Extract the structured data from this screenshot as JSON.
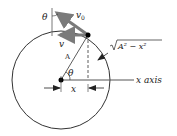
{
  "diagram": {
    "labels": {
      "theta_top": "θ",
      "v0": "v",
      "v0_sub": "0",
      "v": "v",
      "sqrt_expr": "A² − x²",
      "radius": "A",
      "theta_center": "θ",
      "x_axis": "x axis",
      "x_dim": "x"
    },
    "colors": {
      "arrow": "#7a7a7a",
      "line": "#333333",
      "dot": "#000000"
    }
  }
}
